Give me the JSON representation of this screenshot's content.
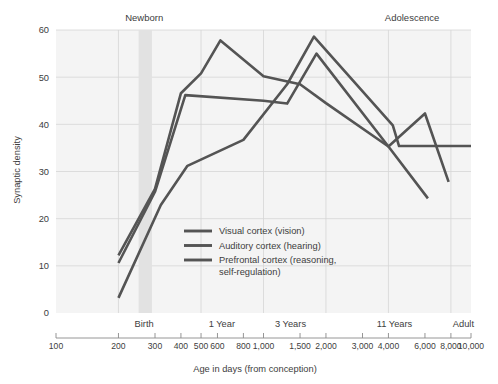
{
  "chart_data": {
    "type": "line",
    "title": "",
    "xlabel": "Age in days (from conception)",
    "ylabel": "Synaptic density",
    "xscale": "log",
    "xlim": [
      100,
      10000
    ],
    "ylim": [
      0,
      60
    ],
    "grid": true,
    "legend_position": "inside-lower-center",
    "x_tick_labels": [
      "100",
      "200",
      "300",
      "400",
      "500",
      "600",
      "800",
      "1,000",
      "1,500",
      "2,000",
      "3,000",
      "4,000",
      "6,000",
      "8,000",
      "10,000"
    ],
    "x_tick_values": [
      100,
      200,
      300,
      400,
      500,
      600,
      800,
      1000,
      1500,
      2000,
      3000,
      4000,
      6000,
      8000,
      10000
    ],
    "y_tick_labels": [
      "0",
      "10",
      "20",
      "30",
      "40",
      "50",
      "60"
    ],
    "y_tick_values": [
      0,
      10,
      20,
      30,
      40,
      50,
      60
    ],
    "stage_annotations": [
      {
        "label": "Birth",
        "x": 266
      },
      {
        "label": "1 Year",
        "x": 630
      },
      {
        "label": "3 Years",
        "x": 1350
      },
      {
        "label": "11 Years",
        "x": 4280
      },
      {
        "label": "Adult",
        "x": 10000
      }
    ],
    "era_annotations": [
      {
        "label": "Newborn",
        "x": 266
      },
      {
        "label": "Adolescence",
        "x": 5200
      }
    ],
    "highlight_band": {
      "label": "Newborn",
      "x_start": 250,
      "x_end": 290
    },
    "series": [
      {
        "name": "Visual cortex (vision)",
        "color": "#545454",
        "points": [
          {
            "x": 200,
            "y": 12.2
          },
          {
            "x": 300,
            "y": 26.3
          },
          {
            "x": 400,
            "y": 46.6
          },
          {
            "x": 500,
            "y": 50.8
          },
          {
            "x": 620,
            "y": 57.8
          },
          {
            "x": 1000,
            "y": 50.2
          },
          {
            "x": 1500,
            "y": 48.5
          },
          {
            "x": 2000,
            "y": 44.5
          },
          {
            "x": 4000,
            "y": 35.3
          },
          {
            "x": 6000,
            "y": 42.3
          },
          {
            "x": 7800,
            "y": 27.8
          }
        ]
      },
      {
        "name": "Auditory cortex (hearing)",
        "color": "#545454",
        "points": [
          {
            "x": 200,
            "y": 10.6
          },
          {
            "x": 300,
            "y": 25.7
          },
          {
            "x": 420,
            "y": 46.2
          },
          {
            "x": 1000,
            "y": 45.0
          },
          {
            "x": 1300,
            "y": 44.4
          },
          {
            "x": 1800,
            "y": 55.0
          },
          {
            "x": 4000,
            "y": 35.3
          },
          {
            "x": 6200,
            "y": 24.3
          }
        ]
      },
      {
        "name": "Prefrontal cortex (reasoning, self-regulation)",
        "color": "#545454",
        "points": [
          {
            "x": 200,
            "y": 3.2
          },
          {
            "x": 320,
            "y": 22.9
          },
          {
            "x": 430,
            "y": 31.2
          },
          {
            "x": 800,
            "y": 36.7
          },
          {
            "x": 1300,
            "y": 48.5
          },
          {
            "x": 1750,
            "y": 58.6
          },
          {
            "x": 4200,
            "y": 39.8
          },
          {
            "x": 4500,
            "y": 35.4
          },
          {
            "x": 10000,
            "y": 35.4
          }
        ]
      }
    ]
  },
  "legend": {
    "items": [
      {
        "label": "Visual cortex (vision)"
      },
      {
        "label": "Auditory cortex (hearing)"
      },
      {
        "label": "Prefrontal cortex (reasoning,"
      },
      {
        "label": "self-regulation)"
      }
    ]
  }
}
